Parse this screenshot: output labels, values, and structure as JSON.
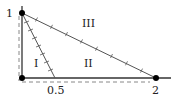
{
  "diagram": {
    "points": {
      "origin": {
        "x": 22,
        "y": 78
      },
      "top": {
        "x": 22,
        "y": 13,
        "label": "1"
      },
      "half": {
        "x": 55,
        "y": 78,
        "label": "0.5"
      },
      "two": {
        "x": 156,
        "y": 78,
        "label": "2"
      }
    },
    "regions": [
      {
        "label": "I",
        "x": 36,
        "y": 64
      },
      {
        "label": "II",
        "x": 89,
        "y": 64
      },
      {
        "label": "III",
        "x": 88,
        "y": 26
      }
    ],
    "colors": {
      "line": "#333333",
      "dashed": "#777777",
      "dot": "#000000"
    }
  }
}
